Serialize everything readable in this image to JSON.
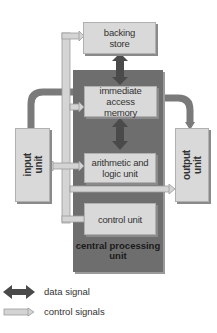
{
  "diagram": {
    "type": "computer architecture block diagram",
    "nodes": {
      "backing_store": "backing\nstore",
      "backing_store_line1": "backing",
      "backing_store_line2": "store",
      "immediate_access_memory_line1": "immediate access",
      "immediate_access_memory_line2": "memory",
      "alu_line1": "arithmetic and",
      "alu_line2": "logic unit",
      "control_unit": "control unit",
      "input_unit_line1": "input",
      "input_unit_line2": "unit",
      "output_unit_line1": "output",
      "output_unit_line2": "unit",
      "cpu_line1": "central processing",
      "cpu_line2": "unit"
    },
    "edges": [
      {
        "from": "backing store",
        "to": "immediate access memory",
        "type": "data signal",
        "direction": "bidirectional"
      },
      {
        "from": "immediate access memory",
        "to": "arithmetic and logic unit",
        "type": "data signal",
        "direction": "bidirectional"
      },
      {
        "from": "input unit",
        "to": "immediate access memory",
        "type": "data signal"
      },
      {
        "from": "immediate access memory",
        "to": "output unit",
        "type": "data signal"
      },
      {
        "from": "control unit",
        "to": "backing store",
        "type": "control signals"
      },
      {
        "from": "control unit",
        "to": "immediate access memory",
        "type": "control signals"
      },
      {
        "from": "control unit",
        "to": "arithmetic and logic unit",
        "type": "control signals"
      },
      {
        "from": "control unit",
        "to": "input unit",
        "type": "control signals"
      },
      {
        "from": "control unit",
        "to": "output unit",
        "type": "control signals"
      }
    ]
  },
  "legend": {
    "data_signal": "data signal",
    "control_signals": "control signals"
  },
  "colors": {
    "cpu_fill": "#6e6e6e",
    "box_fill": "#d9d9d9",
    "data_arrow": "#4a4a4a",
    "control_arrow": "#d4d4d4",
    "io_link": "#7a7a7a"
  }
}
